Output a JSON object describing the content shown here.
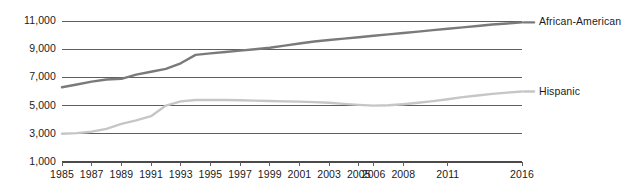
{
  "chart_data": {
    "type": "line",
    "title": "",
    "xlabel": "",
    "ylabel": "",
    "grid": true,
    "legend_position": "right-inline-end-of-line",
    "ylim": [
      1000,
      11000
    ],
    "ytick_values": [
      11000,
      9000,
      7000,
      5000,
      3000,
      1000
    ],
    "ytick_labels": [
      "11,000",
      "9,000",
      "7,000",
      "5,000",
      "3,000",
      "1,000"
    ],
    "x": [
      1985,
      1986,
      1987,
      1988,
      1989,
      1990,
      1991,
      1992,
      1993,
      1994,
      1995,
      1996,
      1997,
      1998,
      1999,
      2000,
      2001,
      2002,
      2003,
      2004,
      2005,
      2006,
      2007,
      2008,
      2009,
      2010,
      2011,
      2012,
      2013,
      2014,
      2015,
      2016
    ],
    "xtick_values": [
      1985,
      1987,
      1989,
      1991,
      1993,
      1995,
      1997,
      1999,
      2001,
      2003,
      2005,
      2006,
      2008,
      2011,
      2016
    ],
    "xtick_labels": [
      "1985",
      "1987",
      "1989",
      "1991",
      "1993",
      "1995",
      "1997",
      "1999",
      "2001",
      "2003",
      "2005",
      "2006",
      "2008",
      "2011",
      "2016"
    ],
    "xlim": [
      1985,
      2016
    ],
    "series": [
      {
        "name": "African-American",
        "color": "#7a7a7a",
        "width": 2.4,
        "label_text": "African-American",
        "values": [
          6300,
          6500,
          6700,
          6850,
          6900,
          7200,
          7400,
          7600,
          8000,
          8600,
          8700,
          8800,
          8900,
          9000,
          9100,
          9250,
          9400,
          9550,
          9650,
          9750,
          9850,
          9950,
          10050,
          10150,
          10250,
          10350,
          10450,
          10550,
          10650,
          10750,
          10820,
          10900
        ]
      },
      {
        "name": "Hispanic",
        "color": "#c6c6c6",
        "width": 2.4,
        "label_text": "Hispanic",
        "values": [
          3000,
          3050,
          3150,
          3350,
          3700,
          3950,
          4250,
          5000,
          5300,
          5400,
          5400,
          5400,
          5380,
          5350,
          5330,
          5300,
          5280,
          5250,
          5200,
          5120,
          5050,
          5000,
          5020,
          5100,
          5200,
          5320,
          5450,
          5600,
          5720,
          5830,
          5920,
          6000
        ]
      }
    ]
  },
  "axis": {
    "baseline_color": "#4a4a4a",
    "gridline_color": "#5e5e5e",
    "text_color": "#1b1b1b"
  }
}
